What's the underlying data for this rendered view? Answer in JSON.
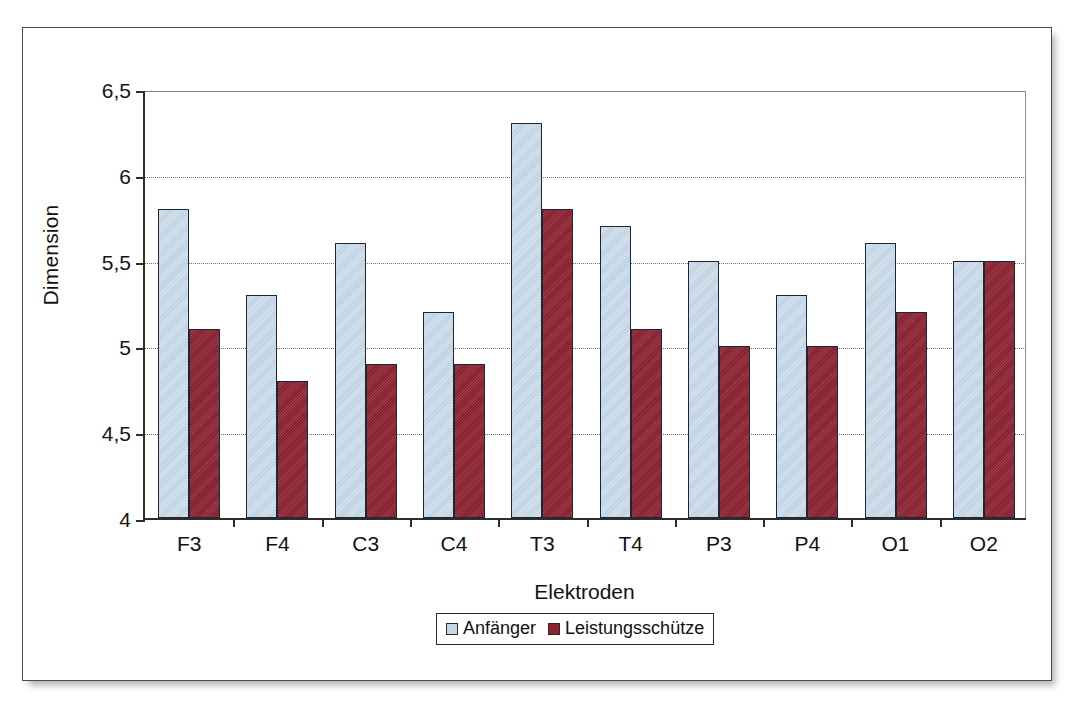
{
  "chart_data": {
    "type": "bar",
    "title": "",
    "xlabel": "Elektroden",
    "ylabel": "Dimension",
    "categories": [
      "F3",
      "F4",
      "C3",
      "C4",
      "T3",
      "T4",
      "P3",
      "P4",
      "O1",
      "O2"
    ],
    "series": [
      {
        "name": "Anfänger",
        "color": "#c3d7e8",
        "values": [
          5.8,
          5.3,
          5.6,
          5.2,
          6.3,
          5.7,
          5.5,
          5.3,
          5.6,
          5.5
        ]
      },
      {
        "name": "Leistungsschütze",
        "color": "#8e2230",
        "values": [
          5.1,
          4.8,
          4.9,
          4.9,
          5.8,
          5.1,
          5.0,
          5.0,
          5.2,
          5.5
        ]
      }
    ],
    "ylim": [
      4,
      6.5
    ],
    "ytick_values": [
      4,
      4.5,
      5,
      5.5,
      6,
      6.5
    ],
    "ytick_labels": [
      "4",
      "4,5",
      "5",
      "5,5",
      "6",
      "6,5"
    ],
    "grid": true,
    "grid_axis": "y",
    "legend_position": "bottom",
    "decimal_separator": ","
  },
  "legend": {
    "entries": [
      {
        "label": "Anfänger"
      },
      {
        "label": "Leistungsschütze"
      }
    ]
  },
  "colors": {
    "series_0": "#c3d7e8",
    "series_1": "#8e2230",
    "axis": "#2d2d2d",
    "grid": "#6f6f6f",
    "frame": "#4a4a4a",
    "background": "#ffffff"
  }
}
